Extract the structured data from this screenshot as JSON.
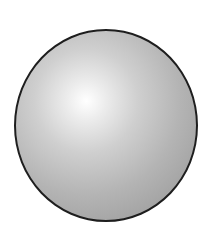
{
  "scene": {
    "background_color": "#ffffff",
    "object": {
      "type": "sphere",
      "outline_color": "#1e1e1e",
      "highlight_color": "#ffffff",
      "shadow_color": "#969696",
      "highlight_position": "upper-left"
    }
  }
}
